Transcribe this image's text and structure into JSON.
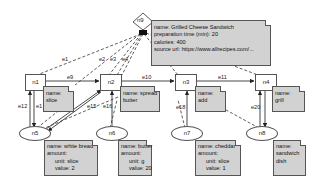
{
  "diagram": {
    "nodes": {
      "n9": {
        "id": "n9",
        "shape": "diamond"
      },
      "n1": {
        "id": "n1",
        "shape": "rect"
      },
      "n2": {
        "id": "n2",
        "shape": "rect"
      },
      "n3": {
        "id": "n3",
        "shape": "rect"
      },
      "n4": {
        "id": "n4",
        "shape": "rect"
      },
      "n5": {
        "id": "n5",
        "shape": "ellipse"
      },
      "n6": {
        "id": "n6",
        "shape": "ellipse"
      },
      "n7": {
        "id": "n7",
        "shape": "ellipse"
      },
      "n8": {
        "id": "n8",
        "shape": "ellipse"
      }
    },
    "notes": {
      "n9": {
        "line1": "name: Grilled Cheese Sandwich",
        "line2": "preparation time (min): 20",
        "line3": "calories: 400",
        "line4": "source url: https://www.allrecipes.com/..."
      },
      "n1": {
        "line1": "name:",
        "line2": "slice"
      },
      "n2": {
        "line1": "name: spread",
        "line2": "butter"
      },
      "n3": {
        "line1": "name:",
        "line2": "add"
      },
      "n4": {
        "line1": "name:",
        "line2": "grill"
      },
      "n5": {
        "line1": "name: white bread",
        "line2": "amount:",
        "line3": "unit: slice",
        "line4": "value: 2"
      },
      "n6": {
        "line1": "name: butter",
        "line2": "amount:",
        "line3": "unit: g",
        "line4": "value: 20"
      },
      "n7": {
        "line1": "name: cheddar",
        "line2": "amount:",
        "line3": "unit: slice",
        "line4": "value: 1"
      },
      "n8": {
        "line1": "name:",
        "line2": "sandwich",
        "line3": "dish"
      }
    },
    "edges": {
      "e1": "e1",
      "e2": "e2",
      "e3": "e3",
      "e4": "e4",
      "e9": "e9",
      "e10": "e10",
      "e11": "e11",
      "e12": "e12",
      "e13": "e1",
      "e15": "e15",
      "e16": "e16",
      "e18": "e18",
      "e20": "e20"
    }
  }
}
